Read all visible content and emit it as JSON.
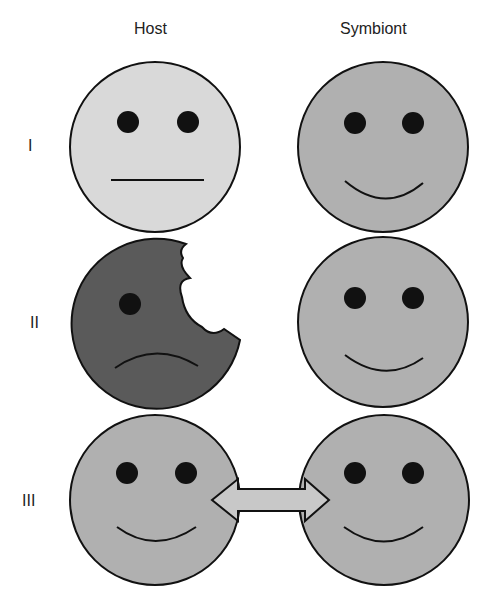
{
  "columns": {
    "host": "Host",
    "symbiont": "Symbiont"
  },
  "rows": [
    {
      "label": "I",
      "host": "neutral face",
      "symbiont": "happy face"
    },
    {
      "label": "II",
      "host": "sad bitten face",
      "symbiont": "happy face"
    },
    {
      "label": "III",
      "host": "happy face",
      "symbiont": "happy face",
      "link": "double-headed arrow"
    }
  ],
  "colors": {
    "host_I": "#d9d9d9",
    "host_II": "#5a5a5a",
    "symbiont": "#b0b0b0",
    "outline": "#111111"
  }
}
